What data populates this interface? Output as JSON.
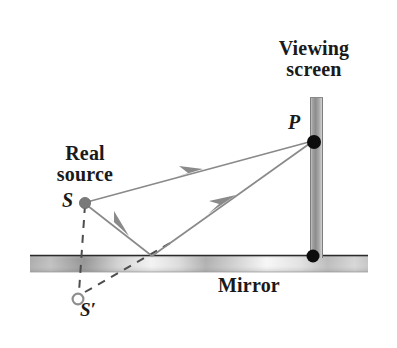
{
  "figure": {
    "background_color": "#ffffff",
    "width": 397,
    "height": 348
  },
  "labels": {
    "viewing_screen_line1": "Viewing",
    "viewing_screen_line2": "screen",
    "real_source_line1": "Real",
    "real_source_line2": "source",
    "mirror": "Mirror",
    "point_p": "P",
    "point_s": "S",
    "point_s_prime": "S′"
  },
  "colors": {
    "ray": "#8a8a8a",
    "arrow": "#8a8a8a",
    "dashed": "#5a5a5a",
    "source_dot": "#7a7a7a",
    "virtual_dot_stroke": "#8f8f8f",
    "virtual_dot_fill": "#ffffff",
    "black_dot": "#0d0d0d",
    "mirror_edge": "#2b2b2b",
    "mirror_light": "#fbfbfb",
    "mirror_dark": "#9a9a9a",
    "screen_edge": "#b5b5b5",
    "screen_fill": "#9e9e9e",
    "text": "#1a1a1a"
  },
  "geometry": {
    "mirror": {
      "x_start": 30,
      "x_end": 368,
      "y_top": 255,
      "y_bottom": 272
    },
    "screen": {
      "x_left": 310,
      "x_right": 323,
      "y_top": 97,
      "y_bottom": 258
    },
    "source_S": {
      "x": 85,
      "y": 203,
      "r": 5.5
    },
    "virtual_source_S_prime": {
      "x": 78,
      "y": 299,
      "r": 5.5
    },
    "point_P": {
      "x": 314,
      "y": 142,
      "r": 7
    },
    "screen_base_dot": {
      "x": 313,
      "y": 256,
      "r": 6.5
    },
    "reflection_point": {
      "x": 152,
      "y": 256
    },
    "direct_ray": {
      "from": [
        85,
        203
      ],
      "to": [
        314,
        142
      ],
      "arrow_at": [
        191,
        174
      ]
    },
    "incident_ray": {
      "from": [
        85,
        203
      ],
      "to": [
        152,
        256
      ],
      "arrow_at": [
        118,
        229
      ]
    },
    "reflected_ray": {
      "from": [
        152,
        256
      ],
      "to": [
        314,
        142
      ],
      "arrow_at": [
        224,
        205
      ]
    },
    "dashed_vertical": {
      "from": [
        85,
        203
      ],
      "to": [
        79,
        293
      ]
    },
    "dashed_virtual_ray": {
      "from": [
        84,
        293
      ],
      "to": [
        170,
        243
      ]
    }
  },
  "annotations": {
    "description": "Light from real source S travels directly to point P on the viewing screen, and also reflects off the mirror surface; the reflected ray appears to originate from virtual source S prime below the mirror."
  }
}
